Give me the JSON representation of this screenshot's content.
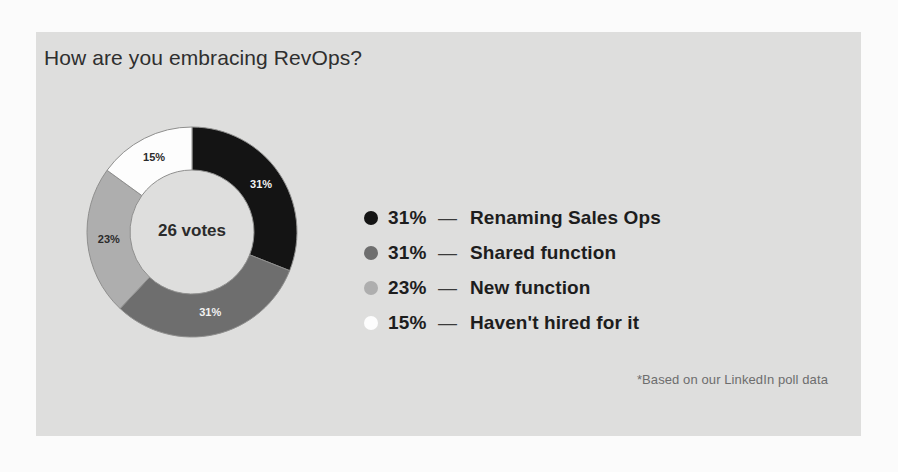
{
  "card": {
    "background_color": "#dededd",
    "page_background_color": "#fbfbfb"
  },
  "chart_data": {
    "type": "pie",
    "variant": "donut",
    "title": "How are you embracing RevOps?",
    "center_label": "26 votes",
    "total_votes": 26,
    "categories": [
      "Renaming Sales Ops",
      "Shared function",
      "New function",
      "Haven't hired for it"
    ],
    "values": [
      31,
      31,
      23,
      15
    ],
    "value_unit": "%",
    "slice_labels": [
      "31%",
      "31%",
      "23%",
      "15%"
    ],
    "colors": [
      "#141414",
      "#6e6e6e",
      "#aeaeae",
      "#fdfdfd"
    ],
    "slice_label_colors": [
      "#f2f2f2",
      "#f2f2f2",
      "#2b2b2b",
      "#2b2b2b"
    ],
    "start_angle_deg": 0,
    "direction": "clockwise",
    "legend_position": "right",
    "grid": false,
    "annotation": "*Based on our LinkedIn poll data"
  },
  "legend": {
    "separator": "—",
    "items": [
      {
        "pct": "31%",
        "label": "Renaming Sales Ops",
        "color": "#141414"
      },
      {
        "pct": "31%",
        "label": "Shared function",
        "color": "#6e6e6e"
      },
      {
        "pct": "23%",
        "label": "New function",
        "color": "#aeaeae"
      },
      {
        "pct": "15%",
        "label": "Haven't hired for it",
        "color": "#fdfdfd"
      }
    ]
  },
  "footnote": {
    "text": "*Based on our LinkedIn poll data"
  }
}
